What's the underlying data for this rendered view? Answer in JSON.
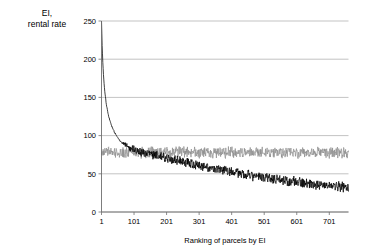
{
  "chart_data": {
    "type": "line",
    "title": "EI,\nrental rate",
    "xlabel": "Ranking of parcels by EI",
    "ylabel": "",
    "xlim": [
      1,
      760
    ],
    "ylim": [
      0,
      250
    ],
    "yticks": [
      0,
      50,
      100,
      150,
      200,
      250
    ],
    "xticks": [
      1,
      101,
      201,
      301,
      401,
      501,
      601,
      701
    ],
    "grid": true,
    "legend": false,
    "colors": {
      "ei_series": "#000000",
      "rental_rate_series": "#8c8c8c",
      "gridline": "#9a9a9a",
      "axis": "#6e6e6e",
      "background": "#ffffff"
    },
    "series": [
      {
        "name": "EI",
        "color": "#000000",
        "description": "Steeply decaying curve from about 250 at rank 1 down through 150 near rank 10, 100 near rank 40, then a noisy slow decline from about 85 to about 32 by rank 760",
        "x": [
          1,
          3,
          5,
          7,
          9,
          11,
          14,
          17,
          20,
          24,
          28,
          33,
          38,
          44,
          50,
          57,
          64,
          72,
          80,
          90,
          100,
          110,
          120,
          130,
          140,
          150,
          160,
          170,
          180,
          190,
          200,
          210,
          220,
          230,
          240,
          250,
          260,
          270,
          280,
          290,
          300,
          310,
          320,
          330,
          340,
          350,
          360,
          370,
          380,
          390,
          400,
          410,
          420,
          430,
          440,
          450,
          460,
          470,
          480,
          490,
          500,
          510,
          520,
          530,
          540,
          550,
          560,
          570,
          580,
          590,
          600,
          610,
          620,
          630,
          640,
          650,
          660,
          670,
          680,
          690,
          700,
          710,
          720,
          730,
          740,
          750,
          760
        ],
        "y": [
          250,
          218,
          196,
          180,
          168,
          158,
          147,
          138,
          131,
          124,
          118,
          112,
          107,
          102,
          98,
          94,
          91,
          88,
          86,
          84,
          83,
          81,
          80,
          78,
          77,
          76,
          75,
          74,
          73,
          72,
          71,
          70,
          69,
          68,
          67,
          66,
          65,
          64,
          63,
          62,
          61,
          60,
          59,
          58,
          57,
          57,
          56,
          55,
          54,
          53,
          53,
          52,
          51,
          50,
          50,
          49,
          48,
          47,
          47,
          46,
          45,
          45,
          44,
          43,
          43,
          42,
          41,
          41,
          40,
          40,
          39,
          39,
          38,
          38,
          37,
          37,
          36,
          36,
          35,
          35,
          34,
          34,
          34,
          33,
          33,
          32,
          32
        ],
        "noise_amplitude": 5.5,
        "noise_start_rank": 45
      },
      {
        "name": "rental rate",
        "color": "#8c8c8c",
        "description": "Flat noisy band oscillating around 78 for the whole ranking range",
        "x": [
          1,
          20,
          40,
          60,
          80,
          100,
          120,
          140,
          160,
          180,
          200,
          220,
          240,
          260,
          280,
          300,
          320,
          340,
          360,
          380,
          400,
          420,
          440,
          460,
          480,
          500,
          520,
          540,
          560,
          580,
          600,
          620,
          640,
          660,
          680,
          700,
          720,
          740,
          760
        ],
        "y": [
          78,
          78,
          78,
          78,
          78,
          78,
          78,
          78,
          78,
          78,
          78,
          78,
          78,
          78,
          78,
          78,
          78,
          78,
          78,
          78,
          78,
          78,
          78,
          78,
          78,
          78,
          78,
          78,
          78,
          78,
          78,
          78,
          78,
          78,
          78,
          78,
          78,
          78,
          78
        ],
        "mean": 78,
        "noise_amplitude": 6.0
      }
    ]
  },
  "figure": {
    "title_lines": [
      "EI,",
      "rental rate"
    ],
    "xaxis_title": "Ranking of parcels by EI",
    "ytick_labels": [
      "250",
      "200",
      "150",
      "100",
      "50",
      "0"
    ],
    "xtick_labels": [
      "1",
      "101",
      "201",
      "301",
      "401",
      "501",
      "601",
      "701"
    ]
  }
}
